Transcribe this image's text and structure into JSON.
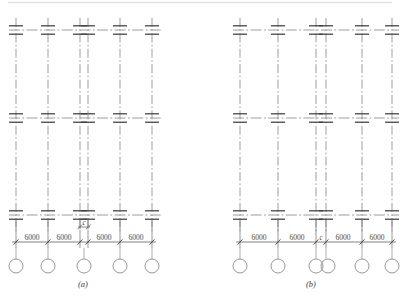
{
  "figure": {
    "type": "structural-frame-elevation",
    "panels": [
      {
        "id": "a",
        "caption": "(a)",
        "origin_x": 14,
        "columns_x": [
          16,
          48,
          80,
          88,
          120,
          152
        ],
        "paired_columns": [
          80,
          88
        ],
        "floor_levels_y": [
          30,
          118,
          215
        ],
        "column_top_y": 18,
        "column_bottom_y": 232,
        "dim_line_y": 242,
        "bubble_y": 266,
        "bubble_r": 7,
        "bubble_x": [
          16,
          48,
          84,
          120,
          152
        ],
        "dimensions": [
          {
            "label": "6000",
            "x1": 16,
            "x2": 48
          },
          {
            "label": "6000",
            "x1": 48,
            "x2": 80
          },
          {
            "label": "6000",
            "x1": 88,
            "x2": 120
          },
          {
            "label": "6000",
            "x1": 120,
            "x2": 152
          }
        ],
        "gap_dimension": {
          "label": "c",
          "x1": 80,
          "x2": 88,
          "y": 227
        }
      },
      {
        "id": "b",
        "caption": "(b)",
        "origin_x": 234,
        "columns_x": [
          240,
          278,
          316,
          324,
          362,
          392
        ],
        "paired_columns": [
          316,
          324
        ],
        "floor_levels_y": [
          30,
          118,
          215
        ],
        "column_top_y": 18,
        "column_bottom_y": 232,
        "dim_line_y": 242,
        "bubble_y": 266,
        "bubble_r": 7,
        "bubble_x": [
          240,
          278,
          316,
          326,
          362,
          392
        ],
        "dimensions": [
          {
            "label": "6000",
            "x1": 240,
            "x2": 278
          },
          {
            "label": "6000",
            "x1": 278,
            "x2": 316
          },
          {
            "label": "c",
            "x1": 316,
            "x2": 324,
            "italic": true
          },
          {
            "label": "6000",
            "x1": 324,
            "x2": 362
          },
          {
            "label": "6000",
            "x1": 362,
            "x2": 392
          }
        ],
        "gap_dimension": null
      }
    ],
    "labels": {
      "span_6000": "6000",
      "gap_c": "c",
      "caption_a": "(a)",
      "caption_b": "(b)"
    },
    "colors": {
      "line": "#555555",
      "centerline": "#8a8a8a",
      "joint": "#3f3f3f",
      "dimension": "#6a6a6a",
      "bubble": "#8d8d8d",
      "text": "#4a4a4a",
      "background": "#ffffff"
    }
  }
}
